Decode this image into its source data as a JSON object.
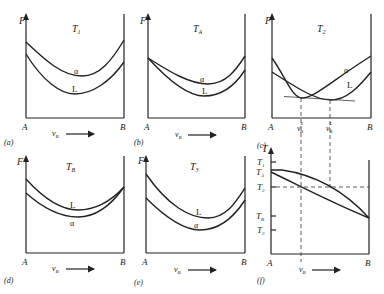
{
  "figure": {
    "panels": [
      {
        "id": "a",
        "label": "(a)",
        "temperature": "T",
        "temp_sub": "1",
        "y_axis": "F",
        "x_start": "A",
        "x_end": "B",
        "x_var": "ν",
        "x_sub": "B",
        "upper_curve": "α",
        "lower_curve": "L"
      },
      {
        "id": "b",
        "label": "(b)",
        "temperature": "T",
        "temp_sub": "A",
        "y_axis": "F",
        "x_start": "A",
        "x_end": "B",
        "x_var": "ν",
        "x_sub": "B",
        "upper_curve": "α",
        "lower_curve": "L"
      },
      {
        "id": "c",
        "label": "(c)",
        "temperature": "T",
        "temp_sub": "2",
        "y_axis": "F",
        "x_start": "A",
        "x_end": "B",
        "x_var": "ν",
        "x_sub": "B",
        "curve1": "α",
        "curve2": "L",
        "mark1": "ν",
        "mark1_sub": "B",
        "mark1_sup": "S",
        "mark2": "ν",
        "mark2_sub": "B",
        "mark2_sup": "L"
      },
      {
        "id": "d",
        "label": "(d)",
        "temperature": "T",
        "temp_sub": "B",
        "y_axis": "F",
        "x_start": "A",
        "x_end": "B",
        "x_var": "ν",
        "x_sub": "B",
        "upper_curve": "L",
        "lower_curve": "α"
      },
      {
        "id": "e",
        "label": "(e)",
        "temperature": "T",
        "temp_sub": "3",
        "y_axis": "F",
        "x_start": "A",
        "x_end": "B",
        "x_var": "ν",
        "x_sub": "B",
        "upper_curve": "L",
        "lower_curve": "α"
      },
      {
        "id": "f",
        "label": "(f)",
        "y_axis": "T",
        "x_start": "A",
        "x_end": "B",
        "x_var": "ν",
        "x_sub": "B",
        "ticks": [
          {
            "t": "T",
            "s": "1"
          },
          {
            "t": "T",
            "s": "A"
          },
          {
            "t": "T",
            "s": "2"
          },
          {
            "t": "T",
            "s": "B"
          },
          {
            "t": "T",
            "s": "3"
          }
        ]
      }
    ]
  }
}
